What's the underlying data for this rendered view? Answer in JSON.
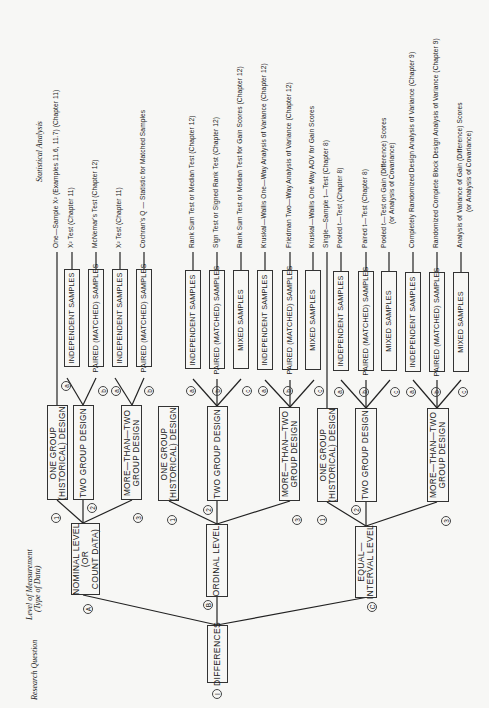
{
  "headings": {
    "research_question": "Research Question",
    "level_of_measurement": "Level of Measurement",
    "type_of_data": "(Type of Data)",
    "statistical_analysis": "Statistical Analysis"
  },
  "root": {
    "marker": "I",
    "label": "DIFFERENCES"
  },
  "levels": [
    {
      "marker": "A",
      "label_line1": "NOMINAL LEVEL",
      "label_line2": "(OR",
      "label_line3": "COUNT DATA)"
    },
    {
      "marker": "B",
      "label_line1": "ORDINAL LEVEL"
    },
    {
      "marker": "C",
      "label_line1": "EQUAL—",
      "label_line2": "INTERVAL LEVEL"
    }
  ],
  "designs": {
    "one_group_1": "ONE GROUP",
    "one_group_2": "(HISTORICAL) DESIGN",
    "two_group": "TWO GROUP DESIGN",
    "more_1": "MORE—THAN—TWO",
    "more_2": "GROUP  DESIGN",
    "m1": "1",
    "m2": "2",
    "m3": "3"
  },
  "samples": {
    "independent": "INDEPENDENT SAMPLES",
    "paired": "PAIRED (MATCHED) SAMPLES",
    "mixed": "MIXED SAMPLES",
    "a": "a",
    "b": "b",
    "c": "c"
  },
  "tests": [
    "One—Sample X²  (Examples 11.6, 11.7) (Chapter 11)",
    "X² Test (Chapter 11)",
    "McNemar's Test (Chapter 12)",
    "X² Test (Chapter 11)",
    "Cochran's Q — Statistic for Matched Samples",
    "Rank Sum Test or Median Test (Chapter 12)",
    "Sign Test or Signed Rank Test (Chapter 12)",
    "Rank Sum Test or Median Test for Gain Scores (Chapter 12)",
    "Kruskal—Wallis One—Way Analysis of Variance (Chapter 12)",
    "Friedman Two—Way Analysis of Variance (Chapter 12)",
    "Kruskal—Wallis One Way AOV for Gain Scores",
    "Single—Sample t—Test (Chapter 8)",
    "Pooled t—Test (Chapter 8)",
    "Paired t—Test (Chapter 8)",
    "Pooled t—Test on Gain (Difference) Scores",
    "Completely Randomized Design Analysis of Variance (Chapter 9)",
    "Randomized Complete Block Design Analysis of Variance (Chapter 9)",
    "Analysis of Variance of Gain (Difference) Scores"
  ],
  "tests_sub": {
    "pooled_gain": "(or Analysis of Covariance)",
    "anova_gain": "(or Analysis of Covariance)"
  }
}
